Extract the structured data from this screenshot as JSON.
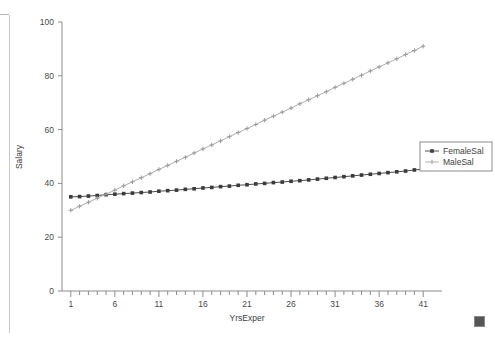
{
  "chart_data": {
    "type": "line",
    "title": "",
    "xlabel": "YrsExper",
    "ylabel": "Salary",
    "xlim": [
      0,
      42
    ],
    "ylim": [
      0,
      100
    ],
    "x_ticks_labeled": [
      1,
      6,
      11,
      16,
      21,
      26,
      31,
      36,
      41
    ],
    "y_ticks_labeled": [
      0,
      20,
      40,
      60,
      80,
      100
    ],
    "x_minor_tick_step": 1,
    "grid": false,
    "legend_position": "right-middle",
    "x": [
      1,
      2,
      3,
      4,
      5,
      6,
      7,
      8,
      9,
      10,
      11,
      12,
      13,
      14,
      15,
      16,
      17,
      18,
      19,
      20,
      21,
      22,
      23,
      24,
      25,
      26,
      27,
      28,
      29,
      30,
      31,
      32,
      33,
      34,
      35,
      36,
      37,
      38,
      39,
      40,
      41
    ],
    "series": [
      {
        "name": "FemaleSal",
        "color": "#3a3a3a",
        "marker": "square",
        "values": [
          35.0,
          35.1,
          35.3,
          35.5,
          35.8,
          36.0,
          36.2,
          36.4,
          36.6,
          36.8,
          37.1,
          37.3,
          37.5,
          37.8,
          38.0,
          38.3,
          38.5,
          38.8,
          39.0,
          39.3,
          39.5,
          39.8,
          40.0,
          40.3,
          40.5,
          40.8,
          41.0,
          41.3,
          41.6,
          41.9,
          42.2,
          42.5,
          42.8,
          43.1,
          43.4,
          43.7,
          44.0,
          44.3,
          44.6,
          45.0,
          45.3
        ]
      },
      {
        "name": "MaleSal",
        "color": "#9a9a9a",
        "marker": "cross",
        "values": [
          30.0,
          31.5,
          33.0,
          34.5,
          36.0,
          37.5,
          39.1,
          40.6,
          42.1,
          43.6,
          45.2,
          46.7,
          48.2,
          49.7,
          51.3,
          52.8,
          54.3,
          55.8,
          57.4,
          58.9,
          60.4,
          61.9,
          63.5,
          65.0,
          66.5,
          68.0,
          69.6,
          71.1,
          72.6,
          74.1,
          75.7,
          77.2,
          78.7,
          80.2,
          81.8,
          83.3,
          84.8,
          86.3,
          87.9,
          89.4,
          91.0
        ]
      }
    ]
  },
  "legend": {
    "entries": [
      "FemaleSal",
      "MaleSal"
    ]
  },
  "labels": {
    "x_axis_title": "YrsExper",
    "y_axis_title": "Salary"
  }
}
